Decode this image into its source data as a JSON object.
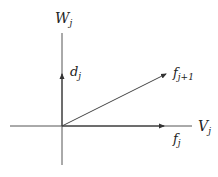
{
  "diagram": {
    "type": "vector-decomposition",
    "axes": {
      "vertical": {
        "label": "W",
        "subscript": "j"
      },
      "horizontal": {
        "label": "V",
        "subscript": "j"
      }
    },
    "vectors": [
      {
        "name": "d",
        "subscript": "j",
        "along": "vertical"
      },
      {
        "name": "f",
        "subscript": "j+1",
        "along": "diagonal"
      },
      {
        "name": "f",
        "subscript": "j",
        "along": "horizontal"
      }
    ],
    "colors": {
      "line": "#555555",
      "text": "#222222",
      "background": "#ffffff"
    }
  }
}
